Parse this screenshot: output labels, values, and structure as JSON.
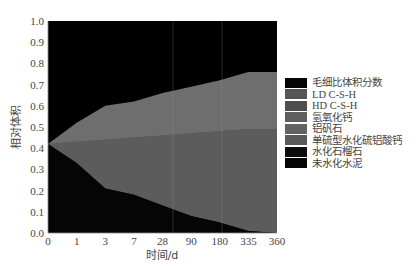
{
  "chart_data": {
    "type": "area",
    "title": "",
    "xlabel": "时间/d",
    "ylabel": "相对体积",
    "categories": [
      "0",
      "1",
      "3",
      "7",
      "28",
      "90",
      "180",
      "335",
      "360"
    ],
    "yticks": [
      "0.0",
      "0.1",
      "0.2",
      "0.3",
      "0.4",
      "0.5",
      "0.6",
      "0.7",
      "0.8",
      "0.9",
      "1.0"
    ],
    "ylim": [
      0,
      1
    ],
    "grid": false,
    "legend_position": "right",
    "boundaries_note": "cumulative upper boundaries of stacked layers, bottom to top",
    "series": [
      {
        "name": "未水化水泥",
        "color": "#050505",
        "upper": [
          0.42,
          0.33,
          0.21,
          0.18,
          0.13,
          0.08,
          0.05,
          0.01,
          0.0
        ]
      },
      {
        "name": "水化石榴石",
        "color": "#111111",
        "upper": [
          0.42,
          0.33,
          0.21,
          0.18,
          0.13,
          0.08,
          0.05,
          0.01,
          0.0
        ]
      },
      {
        "name": "单硫型水化硫铝酸钙",
        "color": "#5a5a5a",
        "upper": [
          0.42,
          0.33,
          0.21,
          0.18,
          0.13,
          0.08,
          0.05,
          0.01,
          0.0
        ]
      },
      {
        "name": "铝矾石",
        "color": "#606060",
        "upper": [
          0.42,
          0.33,
          0.21,
          0.18,
          0.13,
          0.08,
          0.05,
          0.01,
          0.0
        ]
      },
      {
        "name": "氢氧化钙",
        "color": "#5c5c5c",
        "upper": [
          0.42,
          0.43,
          0.44,
          0.45,
          0.46,
          0.47,
          0.48,
          0.49,
          0.49
        ]
      },
      {
        "name": "HD C-S-H",
        "color": "#555555",
        "upper": [
          0.42,
          0.43,
          0.44,
          0.45,
          0.46,
          0.47,
          0.48,
          0.49,
          0.49
        ]
      },
      {
        "name": "LD C-S-H",
        "color": "#6e6e6e",
        "upper": [
          0.42,
          0.52,
          0.6,
          0.62,
          0.66,
          0.69,
          0.72,
          0.76,
          0.76
        ]
      },
      {
        "name": "毛细比体积分数",
        "color": "#000000",
        "upper": [
          1.0,
          1.0,
          1.0,
          1.0,
          1.0,
          1.0,
          1.0,
          1.0,
          1.0
        ]
      }
    ]
  },
  "legend": {
    "items": [
      {
        "label": "毛细比体积分数",
        "color": "#050505"
      },
      {
        "label": "LD C-S-H",
        "color": "#555555"
      },
      {
        "label": "HD C-S-H",
        "color": "#4e4e4e"
      },
      {
        "label": "氢氧化钙",
        "color": "#5e5e5e"
      },
      {
        "label": "铝矾石",
        "color": "#626262"
      },
      {
        "label": "单硫型水化硫铝酸钙",
        "color": "#5a5a5a"
      },
      {
        "label": "水化石榴石",
        "color": "#0d0d0d"
      },
      {
        "label": "未水化水泥",
        "color": "#050505"
      }
    ]
  }
}
